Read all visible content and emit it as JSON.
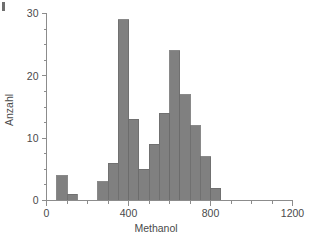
{
  "figure": {
    "background_color": "#ffffff",
    "bar_fill_color": "#808080",
    "bar_edge_color": "#6b6b6b",
    "axis_color": "#8c8c8c",
    "text_color": "#4a4a4a",
    "corner_mark": "page-edge-artifact"
  },
  "chart_data": {
    "type": "bar",
    "title": "",
    "xlabel": "Methanol",
    "ylabel": "Anzahl",
    "xlim": [
      0,
      1200
    ],
    "ylim": [
      0,
      30
    ],
    "xticks": [
      0,
      400,
      800,
      1200
    ],
    "xtick_labels": [
      "0",
      "400",
      "800",
      "1200"
    ],
    "x_minor_tick_interval": 100,
    "yticks": [
      0,
      10,
      20,
      30
    ],
    "ytick_labels": [
      "0",
      "10",
      "20",
      "30"
    ],
    "y_minor_tick_interval": 2.5,
    "grid": false,
    "legend": false,
    "bin_width": 50,
    "bin_edges": [
      50,
      100,
      150,
      250,
      300,
      350,
      400,
      450,
      500,
      550,
      600,
      650,
      700,
      750,
      800,
      850,
      900,
      950,
      1000,
      1050,
      1100
    ],
    "bins": [
      {
        "x0": 50,
        "x1": 100,
        "count": 4
      },
      {
        "x0": 100,
        "x1": 150,
        "count": 1
      },
      {
        "x0": 250,
        "x1": 300,
        "count": 3
      },
      {
        "x0": 300,
        "x1": 350,
        "count": 6
      },
      {
        "x0": 350,
        "x1": 400,
        "count": 29
      },
      {
        "x0": 400,
        "x1": 450,
        "count": 13
      },
      {
        "x0": 450,
        "x1": 500,
        "count": 5
      },
      {
        "x0": 500,
        "x1": 550,
        "count": 9
      },
      {
        "x0": 550,
        "x1": 600,
        "count": 14
      },
      {
        "x0": 600,
        "x1": 650,
        "count": 24
      },
      {
        "x0": 650,
        "x1": 700,
        "count": 17
      },
      {
        "x0": 700,
        "x1": 750,
        "count": 12
      },
      {
        "x0": 750,
        "x1": 800,
        "count": 7
      },
      {
        "x0": 800,
        "x1": 850,
        "count": 2
      }
    ],
    "categories": [
      "50-100",
      "100-150",
      "250-300",
      "300-350",
      "350-400",
      "400-450",
      "450-500",
      "500-550",
      "550-600",
      "600-650",
      "650-700",
      "700-750",
      "750-800",
      "800-850"
    ],
    "values": [
      4,
      1,
      3,
      6,
      29,
      13,
      5,
      9,
      14,
      24,
      17,
      12,
      7,
      2
    ]
  }
}
